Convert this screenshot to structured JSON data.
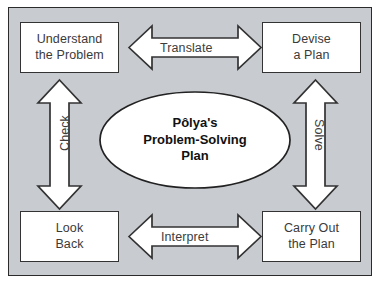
{
  "diagram": {
    "center": {
      "line1": "Pôlya's",
      "line2": "Problem-Solving",
      "line3": "Plan"
    },
    "nodes": [
      {
        "id": "understand",
        "line1": "Understand",
        "line2": "the Problem"
      },
      {
        "id": "devise",
        "line1": "Devise",
        "line2": "a Plan"
      },
      {
        "id": "look_back",
        "line1": "Look",
        "line2": "Back"
      },
      {
        "id": "carry_out",
        "line1": "Carry Out",
        "line2": "the Plan"
      }
    ],
    "connectors": [
      {
        "id": "translate",
        "label": "Translate",
        "orientation": "horizontal",
        "position": "top"
      },
      {
        "id": "solve",
        "label": "Solve",
        "orientation": "vertical",
        "position": "right"
      },
      {
        "id": "interpret",
        "label": "Interpret",
        "orientation": "horizontal",
        "position": "bottom"
      },
      {
        "id": "check",
        "label": "Check",
        "orientation": "vertical",
        "position": "left"
      }
    ],
    "colors": {
      "panel_background": "#c8cbd0",
      "panel_border": "#2b2b2b",
      "shape_fill": "#ffffff",
      "shape_stroke": "#333333",
      "text": "#3a3a3a",
      "center_text": "#111111",
      "page_background": "#ffffff"
    }
  }
}
